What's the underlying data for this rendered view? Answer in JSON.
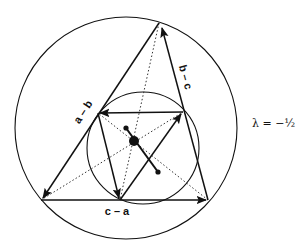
{
  "diagram": {
    "type": "geometric-construction",
    "colors": {
      "stroke": "#111111",
      "background": "#ffffff"
    },
    "outer_circle": {
      "cx": 126,
      "cy": 128,
      "r": 111
    },
    "inner_circle": {
      "cx": 143,
      "cy": 148,
      "r": 56
    },
    "outer_triangle": {
      "vertices": {
        "A": [
          159,
          23
        ],
        "B": [
          41,
          200
        ],
        "C": [
          208,
          200
        ]
      },
      "edges": [
        {
          "from": "A",
          "to": "B",
          "label": "a – b"
        },
        {
          "from": "B",
          "to": "C",
          "label": "c – a"
        },
        {
          "from": "C",
          "to": "A",
          "label": "b – c"
        }
      ]
    },
    "inner_triangle": {
      "vertices": {
        "P": [
          98,
          113
        ],
        "Q": [
          183,
          112
        ],
        "R": [
          120,
          200
        ]
      },
      "edges": [
        {
          "from": "Q",
          "to": "P"
        },
        {
          "from": "P",
          "to": "R"
        },
        {
          "from": "R",
          "to": "Q"
        }
      ]
    },
    "points": {
      "center_large": [
        134,
        141
      ],
      "dot_upper": [
        126,
        128
      ],
      "dot_lower": [
        158,
        172
      ]
    },
    "labels": {
      "edge_ab": "a – b",
      "edge_bc": "b – c",
      "edge_ca": "c – a",
      "parameter": "λ = −½"
    }
  }
}
